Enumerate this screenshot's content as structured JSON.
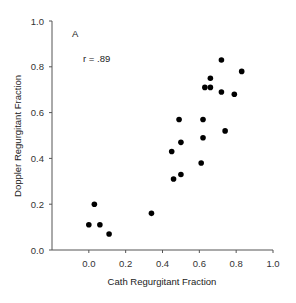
{
  "chart_data": {
    "type": "scatter",
    "title": "",
    "panel_label": "A",
    "annotation": "r = .89",
    "xlabel": "Cath Regurgitant Fraction",
    "ylabel": "Doppler Regurgitant Fraction",
    "xlim": [
      -0.2,
      1.0
    ],
    "ylim": [
      0.0,
      1.0
    ],
    "xticks": [
      "0.0",
      "0.2",
      "0.4",
      "0.6",
      "0.8",
      "1.0"
    ],
    "yticks": [
      "0.0",
      "0.2",
      "0.4",
      "0.6",
      "0.8",
      "1.0"
    ],
    "grid": false,
    "legend": null,
    "series": [
      {
        "name": "patients",
        "marker": "filled-circle",
        "color": "#000000",
        "points": [
          [
            0.0,
            0.11
          ],
          [
            0.03,
            0.2
          ],
          [
            0.06,
            0.11
          ],
          [
            0.11,
            0.07
          ],
          [
            0.34,
            0.16
          ],
          [
            0.45,
            0.43
          ],
          [
            0.46,
            0.31
          ],
          [
            0.49,
            0.57
          ],
          [
            0.5,
            0.33
          ],
          [
            0.5,
            0.47
          ],
          [
            0.61,
            0.38
          ],
          [
            0.62,
            0.49
          ],
          [
            0.62,
            0.57
          ],
          [
            0.63,
            0.71
          ],
          [
            0.66,
            0.71
          ],
          [
            0.66,
            0.75
          ],
          [
            0.72,
            0.83
          ],
          [
            0.72,
            0.69
          ],
          [
            0.74,
            0.52
          ],
          [
            0.79,
            0.68
          ],
          [
            0.83,
            0.78
          ]
        ]
      }
    ]
  }
}
